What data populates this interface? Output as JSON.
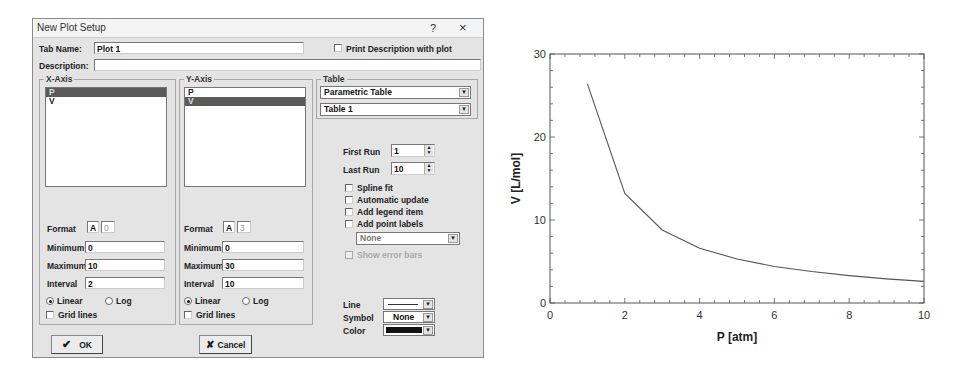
{
  "dialog": {
    "title": "New Plot Setup",
    "help_label": "?",
    "close_label": "×",
    "tab_name_label": "Tab Name:",
    "tab_name_value": "Plot 1",
    "print_description_label": "Print Description with plot",
    "description_label": "Description:",
    "description_value": "",
    "x_axis": {
      "title": "X-Axis",
      "variables": [
        "P",
        "V"
      ],
      "selected": "P",
      "format_label": "Format",
      "format_type": "A",
      "format_digits": "0",
      "minimum_label": "Minimum",
      "minimum_value": "0",
      "maximum_label": "Maximum",
      "maximum_value": "10",
      "interval_label": "Interval",
      "interval_value": "2",
      "linear_label": "Linear",
      "log_label": "Log",
      "scale": "Linear",
      "grid_lines_label": "Grid lines"
    },
    "y_axis": {
      "title": "Y-Axis",
      "variables": [
        "P",
        "V"
      ],
      "selected": "V",
      "format_label": "Format",
      "format_type": "A",
      "format_digits": "3",
      "minimum_label": "Minimum",
      "minimum_value": "0",
      "maximum_label": "Maximum",
      "maximum_value": "30",
      "interval_label": "Interval",
      "interval_value": "10",
      "linear_label": "Linear",
      "log_label": "Log",
      "scale": "Linear",
      "grid_lines_label": "Grid lines"
    },
    "table": {
      "title": "Table",
      "table_type": "Parametric Table",
      "table_name": "Table 1",
      "first_run_label": "First Run",
      "first_run_value": "1",
      "last_run_label": "Last Run",
      "last_run_value": "10",
      "spline_fit_label": "Spline fit",
      "automatic_update_label": "Automatic update",
      "add_legend_item_label": "Add legend item",
      "add_point_labels_label": "Add point labels",
      "point_labels_value": "None",
      "show_error_bars_label": "Show error bars",
      "line_label": "Line",
      "symbol_label": "Symbol",
      "symbol_value": "None",
      "color_label": "Color",
      "color_value": "#111111"
    },
    "ok_label": "OK",
    "cancel_label": "Cancel"
  },
  "chart_data": {
    "type": "line",
    "title": "",
    "xlabel": "P  [atm]",
    "ylabel": "V  [L/mol]",
    "xlim": [
      0,
      10
    ],
    "ylim": [
      0,
      30
    ],
    "xticks": [
      "0",
      "2",
      "4",
      "6",
      "8",
      "10"
    ],
    "yticks": [
      "0",
      "10",
      "20",
      "30"
    ],
    "grid": false,
    "legend": null,
    "x": [
      1,
      2,
      3,
      4,
      5,
      6,
      7,
      8,
      9,
      10
    ],
    "series": [
      {
        "name": "V",
        "values": [
          26.4,
          13.2,
          8.8,
          6.6,
          5.3,
          4.4,
          3.8,
          3.3,
          2.9,
          2.6
        ]
      }
    ]
  }
}
